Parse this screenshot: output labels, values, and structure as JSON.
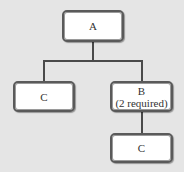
{
  "diagram": {
    "type": "tree",
    "nodes": [
      {
        "id": "A",
        "label": "A",
        "sublabel": ""
      },
      {
        "id": "C-left",
        "label": "C",
        "sublabel": ""
      },
      {
        "id": "B",
        "label": "B",
        "sublabel": "(2 required)"
      },
      {
        "id": "C-bottom",
        "label": "C",
        "sublabel": ""
      }
    ],
    "edges": [
      {
        "from": "A",
        "to": "C-left"
      },
      {
        "from": "A",
        "to": "B"
      },
      {
        "from": "B",
        "to": "C-bottom"
      }
    ],
    "colors": {
      "background": "#e5e5e5",
      "node_fill": "#ffffff",
      "node_border": "#5a5a5a",
      "connector": "#4a4a4a",
      "text": "#333333"
    }
  }
}
